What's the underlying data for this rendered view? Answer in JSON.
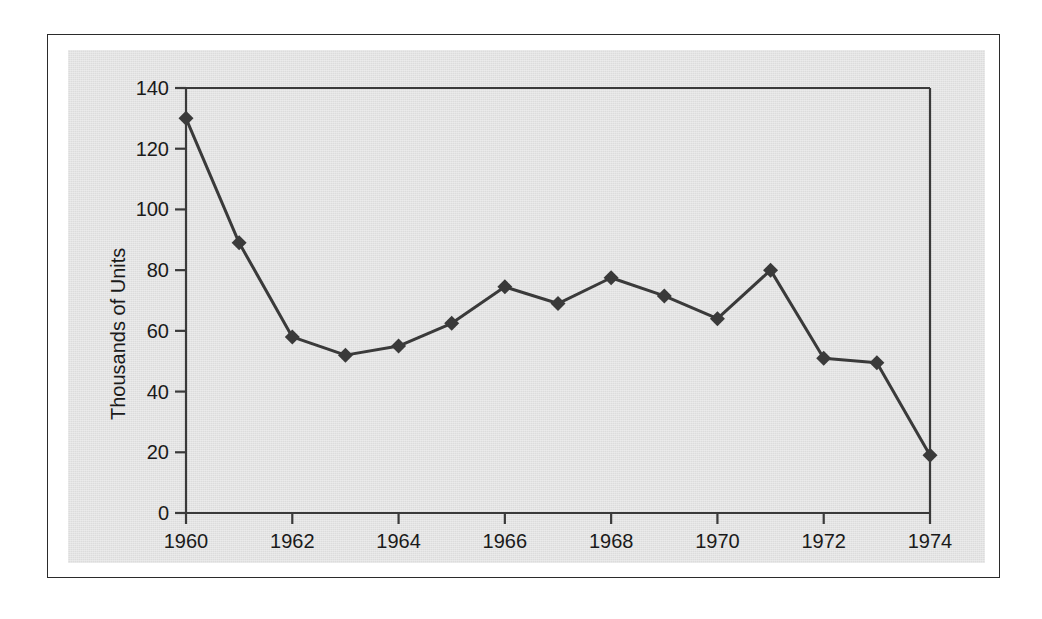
{
  "figure": {
    "panel_background": "#dcdcdc",
    "frame_color": "#2b2b2b",
    "ink_color": "#3a3a3a",
    "text_color": "#1a1a1a"
  },
  "chart_data": {
    "type": "line",
    "title": "",
    "subtitle": "",
    "xlabel": "",
    "ylabel": "Thousands of Units",
    "x": [
      1960,
      1961,
      1962,
      1963,
      1964,
      1965,
      1966,
      1967,
      1968,
      1969,
      1970,
      1971,
      1972,
      1973,
      1974
    ],
    "values": [
      130,
      89,
      58,
      52,
      55,
      62.5,
      74.5,
      69,
      77.5,
      71.5,
      64,
      80,
      51,
      49.5,
      19
    ],
    "series": [
      {
        "name": "Units",
        "values": [
          130,
          89,
          58,
          52,
          55,
          62.5,
          74.5,
          69,
          77.5,
          71.5,
          64,
          80,
          51,
          49.5,
          19
        ],
        "marker": "diamond",
        "color": "#3a3a3a"
      }
    ],
    "xlim": [
      1960,
      1974
    ],
    "ylim": [
      0,
      140
    ],
    "ytick_values": [
      0,
      20,
      40,
      60,
      80,
      100,
      120,
      140
    ],
    "ytick_labels": [
      "0",
      "20",
      "40",
      "60",
      "80",
      "100",
      "120",
      "140"
    ],
    "xtick_values": [
      1960,
      1962,
      1964,
      1966,
      1968,
      1970,
      1972,
      1974
    ],
    "xtick_labels": [
      "1960",
      "1962",
      "1964",
      "1966",
      "1968",
      "1970",
      "1972",
      "1974"
    ],
    "grid": false,
    "legend": null,
    "legend_position": "none",
    "annotations": []
  }
}
